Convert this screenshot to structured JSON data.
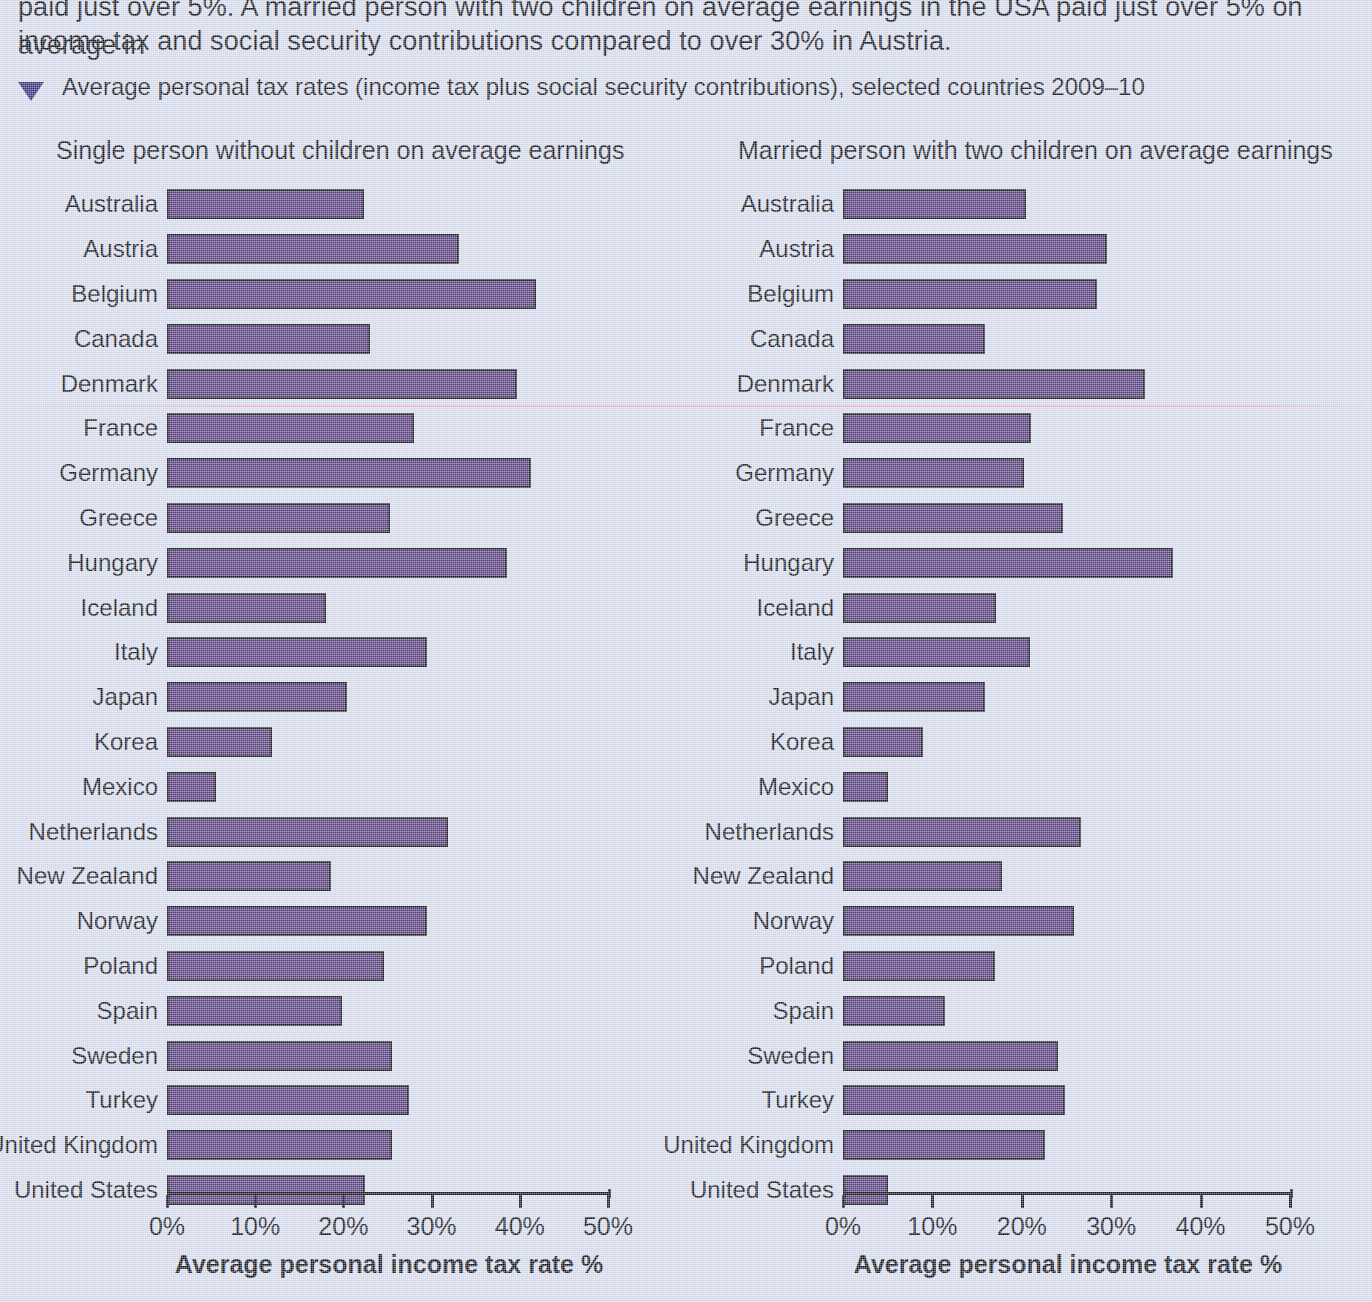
{
  "body_paragraph": {
    "line1": "paid just over 5%. A married person with two children on average earnings in the USA paid just over 5% on average in",
    "line2": "income tax and social security contributions compared to over 30% in Austria."
  },
  "caption": {
    "marker_icon": "triangle-down-icon",
    "text": "Average personal tax rates (income tax plus social security contributions), selected countries 2009–10"
  },
  "colors": {
    "page_background": "#d7dced",
    "bar_fill": "#5a4080",
    "bar_outline": "#1b1b24",
    "text": "#15161c",
    "caption_marker": "#3a2f78"
  },
  "chart_data": [
    {
      "type": "bar",
      "orientation": "horizontal",
      "title": "Single person without children on average earnings",
      "xlabel": "Average personal income tax rate %",
      "ylabel": "",
      "xlim": [
        0,
        50
      ],
      "xticks": [
        0,
        10,
        20,
        30,
        40,
        50
      ],
      "xtick_labels": [
        "0%",
        "10%",
        "20%",
        "30%",
        "40%",
        "50%"
      ],
      "grid": false,
      "legend": "none",
      "categories": [
        "Australia",
        "Austria",
        "Belgium",
        "Canada",
        "Denmark",
        "France",
        "Germany",
        "Greece",
        "Hungary",
        "Iceland",
        "Italy",
        "Japan",
        "Korea",
        "Mexico",
        "Netherlands",
        "New Zealand",
        "Norway",
        "Poland",
        "Spain",
        "Sweden",
        "Turkey",
        "United Kingdom",
        "United States"
      ],
      "values": [
        22.3,
        33.1,
        41.8,
        23.0,
        39.7,
        28.0,
        41.3,
        25.3,
        38.6,
        18.0,
        29.5,
        20.4,
        11.9,
        5.6,
        31.9,
        18.6,
        29.5,
        24.6,
        19.8,
        25.5,
        27.4,
        25.5,
        22.5
      ]
    },
    {
      "type": "bar",
      "orientation": "horizontal",
      "title": "Married person with two children on average earnings",
      "xlabel": "Average personal income tax rate %",
      "ylabel": "",
      "xlim": [
        0,
        50
      ],
      "xticks": [
        0,
        10,
        20,
        30,
        40,
        50
      ],
      "xtick_labels": [
        "0%",
        "10%",
        "20%",
        "30%",
        "40%",
        "50%"
      ],
      "grid": false,
      "legend": "none",
      "categories": [
        "Australia",
        "Austria",
        "Belgium",
        "Canada",
        "Denmark",
        "France",
        "Germany",
        "Greece",
        "Hungary",
        "Iceland",
        "Italy",
        "Japan",
        "Korea",
        "Mexico",
        "Netherlands",
        "New Zealand",
        "Norway",
        "Poland",
        "Spain",
        "Sweden",
        "Turkey",
        "United Kingdom",
        "United States"
      ],
      "values": [
        20.5,
        29.5,
        28.4,
        15.9,
        33.8,
        21.0,
        20.2,
        24.6,
        36.9,
        17.1,
        20.9,
        15.9,
        8.9,
        5.0,
        26.6,
        17.8,
        25.8,
        17.0,
        11.4,
        24.1,
        24.8,
        22.6,
        5.0
      ]
    }
  ]
}
